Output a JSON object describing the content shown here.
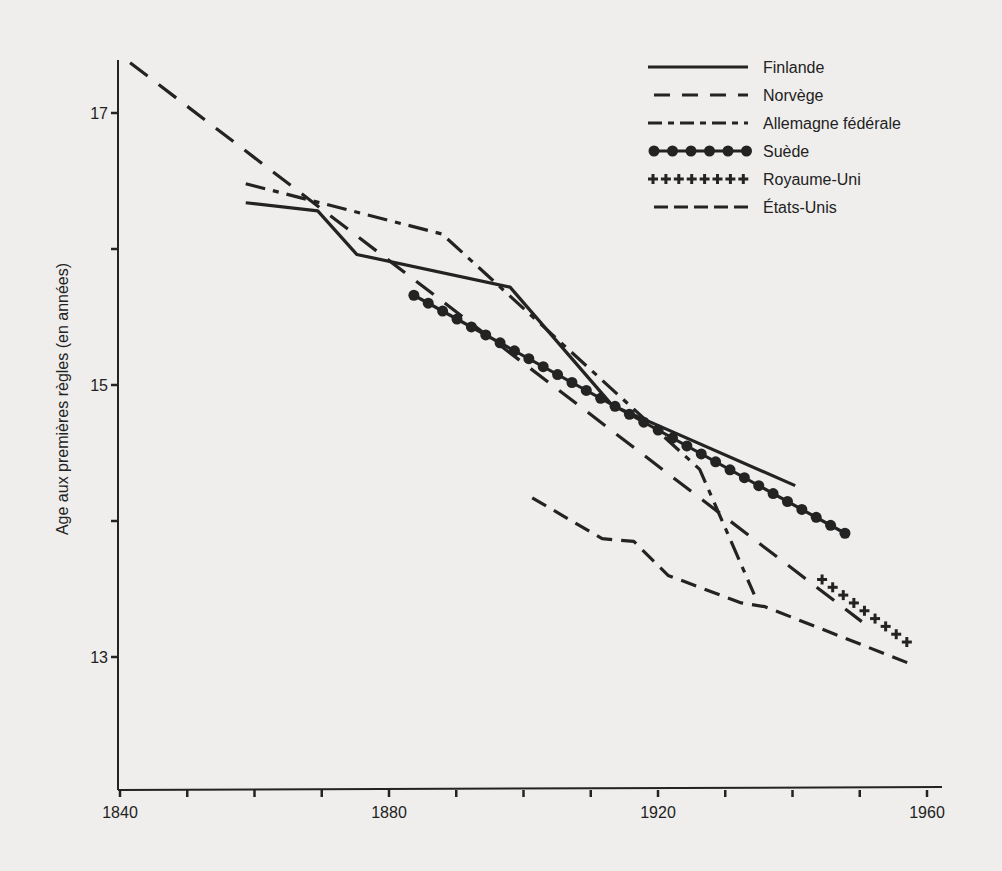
{
  "chart_data": {
    "type": "line",
    "title": "",
    "xlabel": "",
    "ylabel": "Age aux premières règles (en années)",
    "xlim": [
      1840,
      1962
    ],
    "ylim": [
      12.2,
      17.5
    ],
    "x_ticks": [
      1840,
      1850,
      1860,
      1870,
      1880,
      1890,
      1900,
      1910,
      1920,
      1930,
      1940,
      1950,
      1960
    ],
    "x_tick_labels": [
      "1840",
      "1880",
      "1920",
      "1960"
    ],
    "x_tick_labels_at": [
      1840,
      1880,
      1920,
      1960
    ],
    "y_ticks": [
      13,
      14,
      15,
      16,
      17
    ],
    "y_tick_labels": [
      "13",
      "15",
      "17"
    ],
    "y_tick_labels_at": [
      13,
      15,
      17
    ],
    "grid": false,
    "legend_position": "top-right",
    "series": [
      {
        "name": "Finlande",
        "style": "solid",
        "x": [
          1858.7,
          1869.4,
          1875.2,
          1898.0,
          1913.2,
          1940.4
        ],
        "y": [
          16.34,
          16.28,
          15.96,
          15.72,
          14.85,
          14.26
        ]
      },
      {
        "name": "Norvège",
        "style": "dashed",
        "x": [
          1841.5,
          1950.3
        ],
        "y": [
          17.37,
          13.26
        ]
      },
      {
        "name": "Allemagne fédérale",
        "style": "dashdot",
        "x": [
          1858.7,
          1887.9,
          1926.2,
          1934.3
        ],
        "y": [
          16.48,
          16.11,
          14.38,
          13.46
        ]
      },
      {
        "name": "Suède",
        "style": "dots",
        "x": [
          1883.7,
          1947.8
        ],
        "y": [
          15.66,
          13.91
        ]
      },
      {
        "name": "Royaume-Uni",
        "style": "plus",
        "x": [
          1944.4,
          1957.0
        ],
        "y": [
          13.57,
          13.11
        ]
      },
      {
        "name": "États-Unis",
        "style": "shortdash",
        "x": [
          1901.3,
          1911.7,
          1916.4,
          1921.5,
          1932.2,
          1935.9,
          1957.5
        ],
        "y": [
          14.17,
          13.87,
          13.85,
          13.6,
          13.4,
          13.37,
          12.95
        ]
      }
    ]
  },
  "legend": {
    "items": [
      {
        "label": "Finlande"
      },
      {
        "label": "Norvège"
      },
      {
        "label": "Allemagne fédérale"
      },
      {
        "label": "Suède"
      },
      {
        "label": "Royaume-Uni"
      },
      {
        "label": "États-Unis"
      }
    ]
  }
}
